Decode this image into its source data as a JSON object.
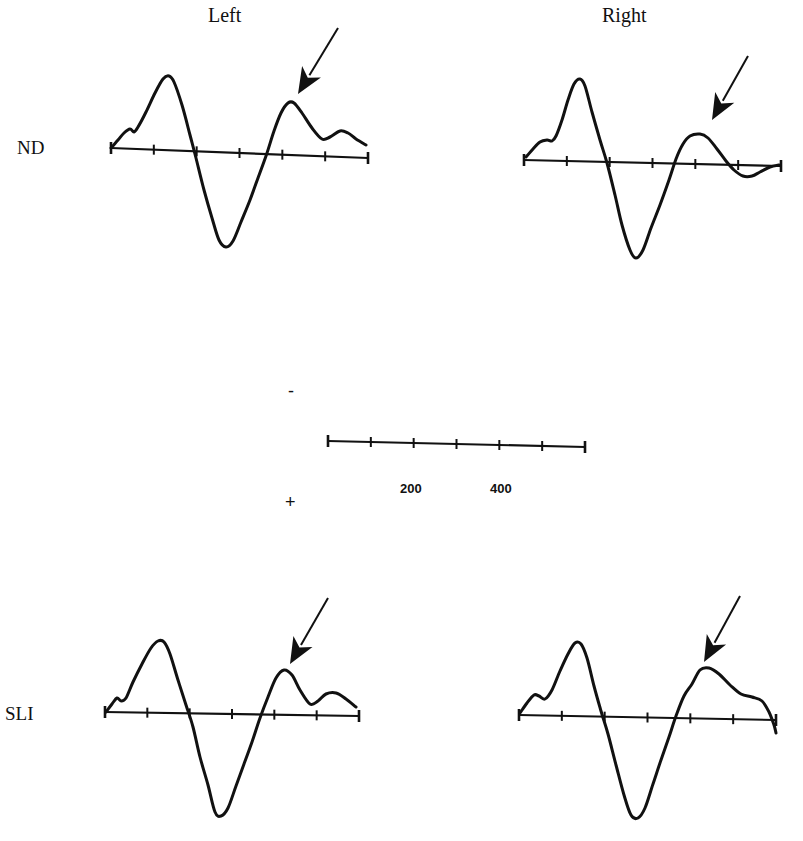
{
  "figure": {
    "column_titles": {
      "left": "Left",
      "right": "Right"
    },
    "row_labels": {
      "top": "ND",
      "bottom": "SLI"
    },
    "scale_bar": {
      "tick_labels": [
        "200",
        "400"
      ],
      "polarity_negative": "-",
      "polarity_positive": "+"
    },
    "colors": {
      "trace": "#111111",
      "background": "#ffffff"
    }
  },
  "chart_data": {
    "type": "line",
    "title": "",
    "xlabel": "Time (ms)",
    "ylabel": "Amplitude (negative up)",
    "x_ticks_ms": [
      0,
      100,
      200,
      300,
      400,
      500,
      600
    ],
    "x_tick_labels_shown": [
      "200",
      "400"
    ],
    "polarity": {
      "up": "-",
      "down": "+"
    },
    "grid": false,
    "annotation": "Arrow marks late positive-going (negative-up) peak ~350 ms",
    "panels": [
      {
        "name": "ND-Left",
        "group": "ND",
        "hemisphere": "Left",
        "axis": {
          "x0": 111,
          "y0": 148,
          "x1": 368,
          "y1": 158
        },
        "points": [
          [
            111,
            148
          ],
          [
            118,
            140
          ],
          [
            124,
            133
          ],
          [
            130,
            129
          ],
          [
            134,
            132
          ],
          [
            138,
            127
          ],
          [
            146,
            112
          ],
          [
            155,
            93
          ],
          [
            163,
            79
          ],
          [
            169,
            76
          ],
          [
            174,
            82
          ],
          [
            182,
            105
          ],
          [
            190,
            135
          ],
          [
            196,
            158
          ],
          [
            204,
            190
          ],
          [
            212,
            218
          ],
          [
            219,
            240
          ],
          [
            226,
            247
          ],
          [
            233,
            241
          ],
          [
            241,
            222
          ],
          [
            250,
            200
          ],
          [
            258,
            178
          ],
          [
            266,
            156
          ],
          [
            274,
            131
          ],
          [
            281,
            113
          ],
          [
            288,
            103
          ],
          [
            294,
            103
          ],
          [
            302,
            113
          ],
          [
            312,
            128
          ],
          [
            322,
            139
          ],
          [
            330,
            137
          ],
          [
            340,
            131
          ],
          [
            348,
            133
          ],
          [
            356,
            139
          ],
          [
            366,
            145
          ]
        ],
        "arrow": {
          "tail": [
            338,
            28
          ],
          "head": [
            298,
            94
          ]
        }
      },
      {
        "name": "ND-Right",
        "group": "ND",
        "hemisphere": "Right",
        "axis": {
          "x0": 524,
          "y0": 160,
          "x1": 781,
          "y1": 166
        },
        "points": [
          [
            526,
            157
          ],
          [
            533,
            149
          ],
          [
            540,
            142
          ],
          [
            547,
            140
          ],
          [
            552,
            141
          ],
          [
            556,
            136
          ],
          [
            562,
            120
          ],
          [
            568,
            100
          ],
          [
            574,
            84
          ],
          [
            580,
            79
          ],
          [
            585,
            86
          ],
          [
            592,
            112
          ],
          [
            600,
            140
          ],
          [
            607,
            163
          ],
          [
            615,
            195
          ],
          [
            622,
            225
          ],
          [
            630,
            250
          ],
          [
            636,
            258
          ],
          [
            643,
            250
          ],
          [
            651,
            228
          ],
          [
            660,
            205
          ],
          [
            669,
            180
          ],
          [
            676,
            159
          ],
          [
            683,
            144
          ],
          [
            690,
            136
          ],
          [
            700,
            134
          ],
          [
            708,
            138
          ],
          [
            717,
            149
          ],
          [
            726,
            161
          ],
          [
            734,
            170
          ],
          [
            743,
            176
          ],
          [
            752,
            176
          ],
          [
            760,
            172
          ],
          [
            770,
            167
          ],
          [
            779,
            165
          ]
        ],
        "arrow": {
          "tail": [
            748,
            56
          ],
          "head": [
            712,
            120
          ]
        }
      },
      {
        "name": "SLI-Left",
        "group": "SLI",
        "hemisphere": "Left",
        "axis": {
          "x0": 105,
          "y0": 712,
          "x1": 359,
          "y1": 716
        },
        "points": [
          [
            106,
            712
          ],
          [
            112,
            704
          ],
          [
            117,
            698
          ],
          [
            121,
            701
          ],
          [
            126,
            698
          ],
          [
            133,
            682
          ],
          [
            142,
            664
          ],
          [
            151,
            648
          ],
          [
            158,
            641
          ],
          [
            164,
            642
          ],
          [
            170,
            654
          ],
          [
            178,
            680
          ],
          [
            186,
            705
          ],
          [
            193,
            727
          ],
          [
            200,
            757
          ],
          [
            208,
            785
          ],
          [
            215,
            812
          ],
          [
            221,
            816
          ],
          [
            228,
            808
          ],
          [
            236,
            786
          ],
          [
            244,
            764
          ],
          [
            252,
            742
          ],
          [
            260,
            718
          ],
          [
            268,
            697
          ],
          [
            276,
            678
          ],
          [
            284,
            670
          ],
          [
            292,
            675
          ],
          [
            300,
            690
          ],
          [
            310,
            704
          ],
          [
            318,
            701
          ],
          [
            326,
            694
          ],
          [
            336,
            693
          ],
          [
            346,
            699
          ],
          [
            356,
            707
          ]
        ],
        "arrow": {
          "tail": [
            328,
            598
          ],
          "head": [
            290,
            664
          ]
        }
      },
      {
        "name": "SLI-Right",
        "group": "SLI",
        "hemisphere": "Right",
        "axis": {
          "x0": 519,
          "y0": 715,
          "x1": 776,
          "y1": 720
        },
        "points": [
          [
            520,
            713
          ],
          [
            527,
            703
          ],
          [
            534,
            695
          ],
          [
            539,
            696
          ],
          [
            545,
            699
          ],
          [
            552,
            690
          ],
          [
            560,
            671
          ],
          [
            568,
            654
          ],
          [
            575,
            643
          ],
          [
            581,
            644
          ],
          [
            587,
            658
          ],
          [
            594,
            686
          ],
          [
            601,
            711
          ],
          [
            608,
            734
          ],
          [
            616,
            765
          ],
          [
            624,
            795
          ],
          [
            631,
            815
          ],
          [
            638,
            818
          ],
          [
            645,
            808
          ],
          [
            653,
            784
          ],
          [
            661,
            760
          ],
          [
            669,
            737
          ],
          [
            676,
            716
          ],
          [
            684,
            696
          ],
          [
            692,
            684
          ],
          [
            700,
            670
          ],
          [
            709,
            668
          ],
          [
            719,
            674
          ],
          [
            730,
            685
          ],
          [
            741,
            694
          ],
          [
            752,
            697
          ],
          [
            762,
            701
          ],
          [
            769,
            712
          ],
          [
            774,
            725
          ],
          [
            776,
            733
          ]
        ],
        "arrow": {
          "tail": [
            740,
            596
          ],
          "head": [
            704,
            662
          ]
        }
      }
    ],
    "scale_bar_axis": {
      "x0": 328,
      "y0": 441,
      "x1": 585,
      "y1": 447,
      "ticks": 7
    }
  }
}
